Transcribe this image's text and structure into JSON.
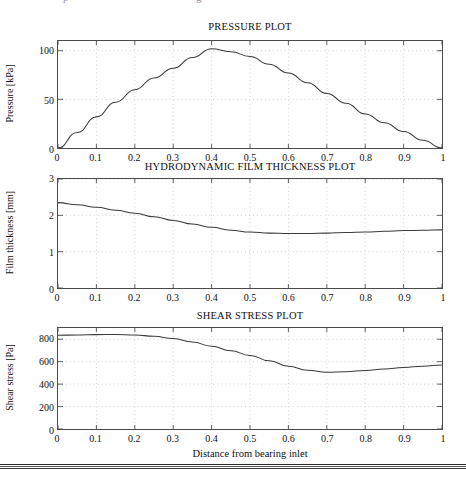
{
  "page": {
    "top_bleed_text": "p g",
    "footer_rule": true
  },
  "figure": {
    "xlabel": "Distance from bearing inlet",
    "x_ticks": [
      "0",
      "0.1",
      "0.2",
      "0.3",
      "0.4",
      "0.5",
      "0.6",
      "0.7",
      "0.8",
      "0.9",
      "1"
    ],
    "line_color": "#3a3a3a",
    "grid_color": "#bdbdbd",
    "axis_color": "#4a4a4a"
  },
  "chart_data": [
    {
      "type": "line",
      "title": "PRESSURE PLOT",
      "ylabel": "Pressure [kPa]",
      "xlabel": "",
      "y_ticks": [
        "0",
        "50",
        "100"
      ],
      "y_tick_values": [
        0,
        50,
        100
      ],
      "ylim": [
        0,
        110
      ],
      "xlim": [
        0,
        1
      ],
      "grid": true,
      "legend": null,
      "x": [
        0,
        0.05,
        0.1,
        0.15,
        0.2,
        0.25,
        0.3,
        0.35,
        0.4,
        0.45,
        0.5,
        0.55,
        0.6,
        0.65,
        0.7,
        0.75,
        0.8,
        0.85,
        0.9,
        0.95,
        1
      ],
      "values": [
        0,
        16,
        32,
        47,
        60,
        72,
        82,
        93,
        102,
        99,
        94,
        86,
        77,
        67,
        56,
        46,
        35,
        26,
        17,
        8,
        0
      ],
      "series": [
        {
          "name": "Pressure",
          "values": [
            0,
            16,
            32,
            47,
            60,
            72,
            82,
            93,
            102,
            99,
            94,
            86,
            77,
            67,
            56,
            46,
            35,
            26,
            17,
            8,
            0
          ]
        }
      ]
    },
    {
      "type": "line",
      "title": "HYDRODYNAMIC FILM THICKNESS PLOT",
      "ylabel": "Film thickness [mm]",
      "xlabel": "",
      "y_ticks": [
        "0",
        "1",
        "2",
        "3"
      ],
      "y_tick_values": [
        0,
        1,
        2,
        3
      ],
      "ylim": [
        0,
        3
      ],
      "xlim": [
        0,
        1
      ],
      "grid": true,
      "legend": null,
      "x": [
        0,
        0.05,
        0.1,
        0.15,
        0.2,
        0.25,
        0.3,
        0.35,
        0.4,
        0.45,
        0.5,
        0.55,
        0.6,
        0.65,
        0.7,
        0.75,
        0.8,
        0.85,
        0.9,
        0.95,
        1
      ],
      "values": [
        2.35,
        2.29,
        2.22,
        2.14,
        2.06,
        1.96,
        1.86,
        1.76,
        1.67,
        1.59,
        1.54,
        1.51,
        1.5,
        1.5,
        1.51,
        1.53,
        1.54,
        1.56,
        1.58,
        1.59,
        1.6
      ],
      "series": [
        {
          "name": "Film thickness",
          "values": [
            2.35,
            2.29,
            2.22,
            2.14,
            2.06,
            1.96,
            1.86,
            1.76,
            1.67,
            1.59,
            1.54,
            1.51,
            1.5,
            1.5,
            1.51,
            1.53,
            1.54,
            1.56,
            1.58,
            1.59,
            1.6
          ]
        }
      ]
    },
    {
      "type": "line",
      "title": "SHEAR STRESS PLOT",
      "ylabel": "Shear stress [Pa]",
      "xlabel": "Distance from bearing inlet",
      "y_ticks": [
        "0",
        "200",
        "400",
        "600",
        "800"
      ],
      "y_tick_values": [
        0,
        200,
        400,
        600,
        800
      ],
      "ylim": [
        0,
        900
      ],
      "xlim": [
        0,
        1
      ],
      "grid": true,
      "legend": null,
      "x": [
        0,
        0.05,
        0.1,
        0.15,
        0.2,
        0.25,
        0.3,
        0.35,
        0.4,
        0.45,
        0.5,
        0.55,
        0.6,
        0.65,
        0.7,
        0.75,
        0.8,
        0.85,
        0.9,
        0.95,
        1
      ],
      "values": [
        835,
        838,
        841,
        842,
        838,
        826,
        806,
        775,
        738,
        697,
        655,
        608,
        560,
        524,
        505,
        510,
        522,
        535,
        548,
        560,
        570
      ],
      "series": [
        {
          "name": "Shear stress",
          "values": [
            835,
            838,
            841,
            842,
            838,
            826,
            806,
            775,
            738,
            697,
            655,
            608,
            560,
            524,
            505,
            510,
            522,
            535,
            548,
            560,
            570
          ]
        }
      ]
    }
  ]
}
